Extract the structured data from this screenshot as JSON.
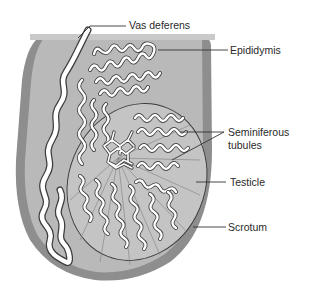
{
  "figure": {
    "type": "anatomical-diagram",
    "colors": {
      "background": "#ffffff",
      "scrotum_wall": "#8e8e8e",
      "scrotum_interior": "#b9b9b9",
      "testicle_fill": "#c4c4c4",
      "testicle_outline": "#3a3a3a",
      "tubule_fill": "#ffffff",
      "tubule_outline": "#3d3d3d",
      "label_text": "#2a2a2a",
      "leader_line": "#333333"
    }
  },
  "labels": [
    {
      "id": "vas_deferens",
      "text": "Vas deferens"
    },
    {
      "id": "epididymis",
      "text": "Epididymis"
    },
    {
      "id": "seminiferous_line1",
      "text": "Seminiferous"
    },
    {
      "id": "seminiferous_line2",
      "text": "tubules"
    },
    {
      "id": "testicle",
      "text": "Testicle"
    },
    {
      "id": "scrotum",
      "text": "Scrotum"
    }
  ]
}
